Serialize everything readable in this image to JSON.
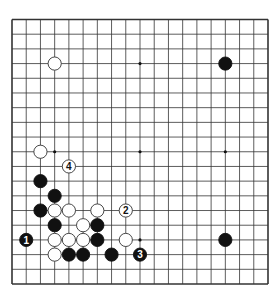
{
  "board": {
    "size": 19,
    "grid": {
      "left": 12,
      "top": 19.5,
      "right": 268,
      "bottom": 284
    },
    "colors": {
      "background": "#ffffff",
      "line": "#333333",
      "black_stone": "#111111",
      "white_stone": "#ffffff",
      "white_stroke": "#333333"
    },
    "star_points": [
      [
        3,
        3
      ],
      [
        9,
        3
      ],
      [
        15,
        3
      ],
      [
        3,
        9
      ],
      [
        9,
        9
      ],
      [
        15,
        9
      ],
      [
        3,
        15
      ],
      [
        9,
        15
      ],
      [
        15,
        15
      ]
    ],
    "stones": [
      {
        "color": "white",
        "col": 3,
        "row": 3
      },
      {
        "color": "black",
        "col": 15,
        "row": 3
      },
      {
        "color": "white",
        "col": 2,
        "row": 9
      },
      {
        "color": "black",
        "col": 2,
        "row": 11
      },
      {
        "color": "black",
        "col": 3,
        "row": 12
      },
      {
        "color": "black",
        "col": 2,
        "row": 13
      },
      {
        "color": "white",
        "col": 3,
        "row": 13
      },
      {
        "color": "white",
        "col": 4,
        "row": 13
      },
      {
        "color": "white",
        "col": 6,
        "row": 13
      },
      {
        "color": "black",
        "col": 3,
        "row": 14
      },
      {
        "color": "white",
        "col": 5,
        "row": 14
      },
      {
        "color": "black",
        "col": 6,
        "row": 14
      },
      {
        "color": "white",
        "col": 3,
        "row": 15
      },
      {
        "color": "white",
        "col": 4,
        "row": 15
      },
      {
        "color": "white",
        "col": 5,
        "row": 15
      },
      {
        "color": "black",
        "col": 6,
        "row": 15
      },
      {
        "color": "white",
        "col": 8,
        "row": 15
      },
      {
        "color": "white",
        "col": 3,
        "row": 16
      },
      {
        "color": "black",
        "col": 4,
        "row": 16
      },
      {
        "color": "black",
        "col": 5,
        "row": 16
      },
      {
        "color": "black",
        "col": 7,
        "row": 16
      },
      {
        "color": "black",
        "col": 15,
        "row": 15
      }
    ],
    "numbered_moves": [
      {
        "number": "1",
        "color": "black",
        "col": 1,
        "row": 15
      },
      {
        "number": "2",
        "color": "white",
        "col": 8,
        "row": 13
      },
      {
        "number": "3",
        "color": "black",
        "col": 9,
        "row": 16
      },
      {
        "number": "4",
        "color": "white",
        "col": 4,
        "row": 10
      }
    ]
  }
}
